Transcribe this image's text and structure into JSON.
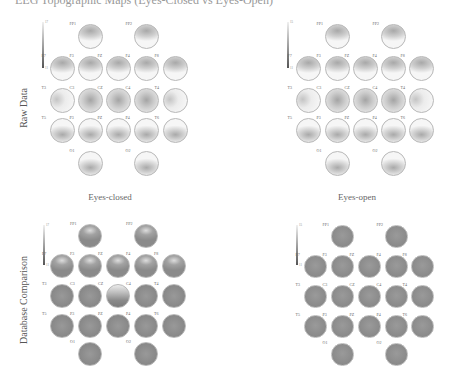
{
  "figure": {
    "cut_title": "EEG Topographic Maps (Eyes-Closed vs Eyes-Open)",
    "row_labels": [
      "Raw Data",
      "Database Comparison"
    ],
    "column_labels": [
      "Eyes-closed",
      "Eyes-open"
    ],
    "electrode_labels": [
      "FP1",
      "FP2",
      "F7",
      "F3",
      "FZ",
      "F4",
      "F8",
      "T3",
      "C3",
      "CZ",
      "C4",
      "T4",
      "T5",
      "P3",
      "PZ",
      "P4",
      "T6",
      "O1",
      "O2"
    ],
    "colors": {
      "raw_fill_light": "#f4f4f4",
      "raw_fill_dark": "#9a9a9a",
      "db_fill": "#8e8e8e",
      "db_fill_light": "#d8d8d8",
      "circle_border": "#b8b8b8",
      "colorbar_dark": "#555555"
    }
  },
  "panels": [
    {
      "id": "raw-eyes-closed",
      "row": "Raw Data",
      "column": "Eyes-closed",
      "colorbar": {
        "x": 42,
        "top": 22,
        "height": 46,
        "tick_top": "17",
        "tick_bottom": "11"
      }
    },
    {
      "id": "raw-eyes-open",
      "row": "Raw Data",
      "column": "Eyes-open",
      "colorbar": {
        "x": 287,
        "top": 22,
        "height": 46,
        "tick_top": "15",
        "tick_bottom": "11"
      }
    },
    {
      "id": "db-eyes-closed",
      "row": "Database Comparison",
      "column": "Eyes-closed",
      "colorbar": {
        "x": 43,
        "top": 225,
        "height": 40,
        "tick_top": "17",
        "tick_bottom": "11"
      }
    },
    {
      "id": "db-eyes-open",
      "row": "Database Comparison",
      "column": "Eyes-open",
      "colorbar": {
        "x": 296,
        "top": 225,
        "height": 40,
        "tick_top": "15",
        "tick_bottom": "11"
      }
    }
  ]
}
